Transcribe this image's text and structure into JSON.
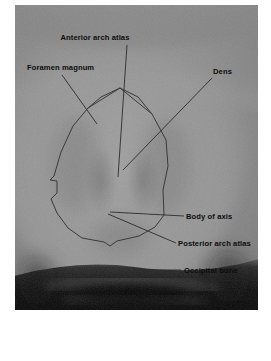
{
  "figure": {
    "kind": "annotated-radiograph",
    "modality": "open-mouth odontoid radiograph",
    "plate": {
      "left": 15,
      "top": 5,
      "width": 243,
      "height": 305,
      "background_color": "#8a8a8a",
      "bone_highlight_color": "#a8a8a8",
      "soft_tissue_color": "#7c7c7c",
      "dark_band_color": "#141414"
    },
    "annotation_colors": {
      "label_text": "#0d0d0d",
      "leader_line": "#2b2b2b",
      "trace_outline": "#3a3a3a"
    }
  },
  "labels": [
    {
      "id": "anterior-arch-atlas",
      "text": "Anterior arch atlas",
      "text_x": 95,
      "text_y": 40,
      "anchor": "middle",
      "leader": [
        [
          127,
          45
        ],
        [
          118,
          177
        ]
      ]
    },
    {
      "id": "foramen-magnum",
      "text": "Foramen magnum",
      "text_x": 27,
      "text_y": 70,
      "anchor": "start",
      "leader": [
        [
          62,
          75
        ],
        [
          97,
          124
        ]
      ]
    },
    {
      "id": "dens",
      "text": "Dens",
      "text_x": 213,
      "text_y": 74,
      "anchor": "start",
      "leader": [
        [
          212,
          78
        ],
        [
          123,
          170
        ]
      ]
    },
    {
      "id": "body-of-axis",
      "text": "Body of axis",
      "text_x": 186,
      "text_y": 219,
      "anchor": "start",
      "leader": [
        [
          184,
          216
        ],
        [
          110,
          212
        ]
      ]
    },
    {
      "id": "posterior-arch-atlas",
      "text": "Posterior arch atlas",
      "text_x": 178,
      "text_y": 246,
      "anchor": "start",
      "leader": [
        [
          176,
          243
        ],
        [
          108,
          214
        ]
      ]
    },
    {
      "id": "occipital-bone",
      "text": "Occipital bone",
      "text_x": 184,
      "text_y": 273,
      "anchor": "start",
      "leader": [
        [
          135,
          270
        ],
        [
          181,
          270
        ]
      ]
    }
  ],
  "traced_outline": {
    "id": "foramen-magnum-outline",
    "description": "hand-traced polygon ring around the foramen magnum",
    "points": "120,88 101,97 88,108 73,126 61,152 54,176 50,180 57,181 57,193 51,199 57,213 68,228 82,238 104,242 110,246 117,241 139,236 155,227 164,215 163,190 168,166 166,140 152,114 138,97 120,88"
  },
  "internal_traces": [
    {
      "id": "atlas-arch-trace-left",
      "points": "88,108 120,88"
    },
    {
      "id": "atlas-arch-trace-right",
      "points": "120,88 152,114"
    }
  ]
}
